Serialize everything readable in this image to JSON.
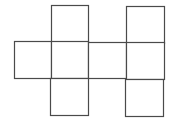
{
  "diagram": {
    "type": "cube-net",
    "stroke_color": "#4a4a4a",
    "background": "#ffffff",
    "faces": [
      {
        "id": "top-left",
        "row": 0,
        "col": 1,
        "x": 51,
        "y": 5,
        "w": 37,
        "h": 37
      },
      {
        "id": "top-right",
        "row": 0,
        "col": 3,
        "x": 126,
        "y": 6,
        "w": 38,
        "h": 37
      },
      {
        "id": "middle-1",
        "row": 1,
        "col": 0,
        "x": 14,
        "y": 41,
        "w": 37,
        "h": 37
      },
      {
        "id": "middle-2",
        "row": 1,
        "col": 1,
        "x": 51,
        "y": 41,
        "w": 37,
        "h": 37
      },
      {
        "id": "middle-3",
        "row": 1,
        "col": 2,
        "x": 88,
        "y": 42,
        "w": 38,
        "h": 36
      },
      {
        "id": "middle-4",
        "row": 1,
        "col": 3,
        "x": 126,
        "y": 42,
        "w": 38,
        "h": 37
      },
      {
        "id": "bottom-left",
        "row": 2,
        "col": 1,
        "x": 50,
        "y": 78,
        "w": 38,
        "h": 37
      },
      {
        "id": "bottom-right",
        "row": 2,
        "col": 3,
        "x": 125,
        "y": 79,
        "w": 38,
        "h": 37
      }
    ]
  }
}
